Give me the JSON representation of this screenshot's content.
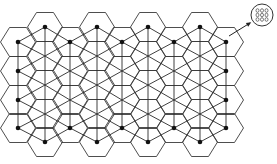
{
  "diagram": {
    "title": "",
    "description": "Hexagonal cell network with triangulated lattice connections; boundary nodes marked with black dots; inset shows a magnified cell containing a 3x3 array of elements",
    "colors": {
      "line": "#2a2a2a",
      "node": "#111111",
      "background": "#ffffff"
    },
    "lattice": {
      "even_columns_x": [
        18,
        70,
        122,
        174,
        226
      ],
      "even_rows_y": [
        42,
        71,
        100,
        128
      ],
      "odd_columns_x": [
        45,
        97,
        148,
        200
      ],
      "odd_rows_y": [
        27,
        56,
        85,
        114,
        142
      ]
    },
    "highlighted_nodes": [
      [
        45,
        27
      ],
      [
        97,
        27
      ],
      [
        148,
        27
      ],
      [
        200,
        27
      ],
      [
        18,
        42
      ],
      [
        18,
        71
      ],
      [
        18,
        100
      ],
      [
        18,
        128
      ],
      [
        226,
        42
      ],
      [
        226,
        71
      ],
      [
        226,
        100
      ],
      [
        226,
        128
      ],
      [
        70,
        128
      ],
      [
        122,
        128
      ],
      [
        174,
        128
      ],
      [
        45,
        142
      ],
      [
        97,
        142
      ],
      [
        148,
        142
      ],
      [
        200,
        142
      ],
      [
        70,
        42
      ],
      [
        122,
        42
      ],
      [
        174,
        42
      ]
    ],
    "inset": {
      "label": "magnified cell",
      "center": [
        262,
        15
      ],
      "radius": 11,
      "grid_rows": 3,
      "grid_cols": 3
    },
    "arrow": {
      "from": [
        229,
        36
      ],
      "to": [
        250,
        23
      ]
    }
  }
}
